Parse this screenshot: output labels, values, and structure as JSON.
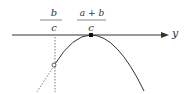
{
  "diagram": {
    "axis_label": "y",
    "point_left": {
      "numerator": "b",
      "denominator": "c",
      "sign": "−",
      "marker": "open-circle"
    },
    "point_peak": {
      "numerator": "a + b",
      "denominator": "c",
      "marker": "filled-square"
    },
    "colors": {
      "line": "#333333",
      "background": "#ffffff"
    }
  }
}
